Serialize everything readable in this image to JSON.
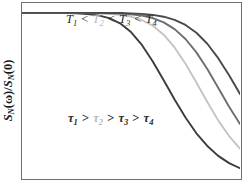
{
  "figure": {
    "background_color": "#ffffff",
    "frame_color": "#6f6f6f"
  },
  "axes": {
    "ylabel_parts": {
      "s1": "S",
      "sub1": "N",
      "omega": "(ω)",
      "slash": "/",
      "s2": "S",
      "sub2": "N",
      "zero": "(0)"
    },
    "ylabel_text": "S_N(ω)/S_N(0)",
    "xlabel_text": "",
    "ticks_visible": false,
    "grid": false
  },
  "annotations": [
    {
      "name": "temperature-ordering",
      "text": "T1 < T2 < T3 < T4",
      "parts": [
        {
          "sym": "T",
          "sub": "1",
          "op": "<"
        },
        {
          "sym": "T",
          "sub": "2",
          "op": "<"
        },
        {
          "sym": "T",
          "sub": "3",
          "op": "<"
        },
        {
          "sym": "T",
          "sub": "4",
          "op": ""
        }
      ]
    },
    {
      "name": "tau-ordering",
      "text": "τ1 > τ2 > τ3 > τ4",
      "parts": [
        {
          "sym": "τ",
          "sub": "1",
          "op": ">"
        },
        {
          "sym": "τ",
          "sub": "2",
          "op": ">"
        },
        {
          "sym": "τ",
          "sub": "3",
          "op": ">"
        },
        {
          "sym": "τ",
          "sub": "4",
          "op": ""
        }
      ]
    }
  ],
  "chart_data": {
    "type": "line",
    "title": "",
    "subtitle": "",
    "xlabel": "",
    "ylabel": "S_N(ω)/S_N(0)",
    "xlim": [
      0,
      1
    ],
    "ylim": [
      0,
      1.06
    ],
    "grid": false,
    "legend_position": "none",
    "x": [
      0.0,
      0.05,
      0.1,
      0.15,
      0.2,
      0.25,
      0.3,
      0.35,
      0.4,
      0.45,
      0.5,
      0.55,
      0.6,
      0.65,
      0.7,
      0.75,
      0.8,
      0.85,
      0.9,
      0.95,
      1.0
    ],
    "series": [
      {
        "name": "tau_1",
        "label": "τ1",
        "color": "#3c3c3c",
        "linewidth": 1.9,
        "values": [
          1.0,
          1.0,
          1.0,
          1.0,
          0.999,
          0.997,
          0.993,
          0.985,
          0.968,
          0.937,
          0.884,
          0.806,
          0.706,
          0.592,
          0.475,
          0.366,
          0.271,
          0.194,
          0.134,
          0.09,
          0.059
        ]
      },
      {
        "name": "tau_2",
        "label": "τ2",
        "color": "#c4c4c4",
        "linewidth": 1.9,
        "values": [
          1.0,
          1.0,
          1.0,
          1.0,
          1.0,
          1.0,
          0.999,
          0.998,
          0.995,
          0.989,
          0.978,
          0.957,
          0.922,
          0.868,
          0.791,
          0.692,
          0.578,
          0.46,
          0.349,
          0.254,
          0.178
        ]
      },
      {
        "name": "tau_3",
        "label": "τ3",
        "color": "#6e6e6e",
        "linewidth": 1.9,
        "values": [
          1.0,
          1.0,
          1.0,
          1.0,
          1.0,
          1.0,
          1.0,
          0.999,
          0.998,
          0.996,
          0.992,
          0.984,
          0.969,
          0.943,
          0.902,
          0.842,
          0.761,
          0.66,
          0.547,
          0.432,
          0.327
        ]
      },
      {
        "name": "tau_4",
        "label": "τ4",
        "color": "#4a4a4a",
        "linewidth": 1.9,
        "values": [
          1.0,
          1.0,
          1.0,
          1.0,
          1.0,
          1.0,
          1.0,
          1.0,
          0.999,
          0.999,
          0.997,
          0.994,
          0.988,
          0.977,
          0.958,
          0.927,
          0.88,
          0.813,
          0.726,
          0.622,
          0.509
        ]
      }
    ]
  }
}
